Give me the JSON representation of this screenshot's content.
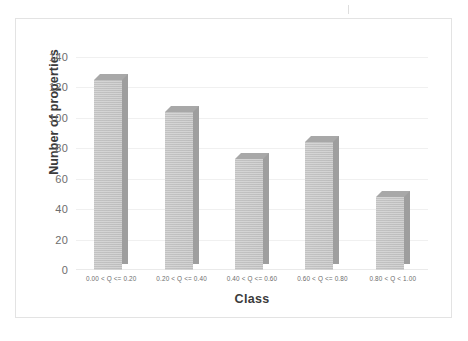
{
  "chart_data": {
    "type": "bar",
    "title": "",
    "subtitle": "",
    "xlabel": "Class",
    "ylabel": "Nunber of properties",
    "categories": [
      "0.00 < Q  <= 0.20",
      "0.20 < Q <= 0.40",
      "0.40 < Q <= 0.60",
      "0.60 < Q <= 0.80",
      "0.80 < Q < 1.00"
    ],
    "values": [
      125,
      104,
      73,
      84,
      48
    ],
    "ylim": [
      0,
      140
    ],
    "ytick_labels": [
      "140",
      "120",
      "100",
      "80",
      "60",
      "40",
      "20",
      "0"
    ],
    "ytick_values": [
      140,
      120,
      100,
      80,
      60,
      40,
      20,
      0
    ],
    "grid": true,
    "grid_axis": "y",
    "legend": false,
    "legend_position": "none",
    "style": "3d-column",
    "bar_color": "#c2c2c2",
    "bar_side_color": "#9e9e9e",
    "bar_top_color": "#a8a8a8",
    "gridline_color": "#f0f0f0",
    "frame_color": "#e3e3e3",
    "text_color": "#6d6d6d",
    "title_color": "#3b3b3b",
    "background": "#ffffff"
  }
}
